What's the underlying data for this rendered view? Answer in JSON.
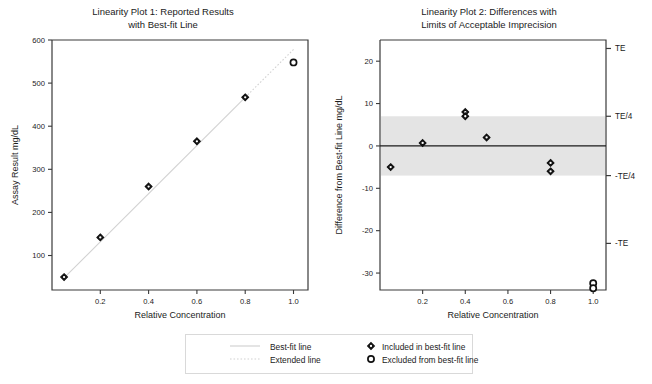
{
  "figure": {
    "width": 652,
    "height": 384,
    "background": "#ffffff"
  },
  "legend": {
    "items": [
      {
        "label": "Best-fit line",
        "marker": "solid-line-swatch"
      },
      {
        "label": "Extended line",
        "marker": "dotted-line-swatch"
      },
      {
        "label": "Included in best-fit line",
        "marker": "filled-diamond-swatch"
      },
      {
        "label": "Excluded from best-fit line",
        "marker": "open-circle-swatch"
      }
    ]
  },
  "colors": {
    "axis": "#3a3a3a",
    "text": "#1b1b1b",
    "marker_included": "#111111",
    "marker_excluded": "#111111",
    "fit_line": "#d2d2d2",
    "extended_line": "#d2d2d2",
    "band_fill": "#e4e4e4",
    "zero_line": "#1b1b1b",
    "legend_border": "#d9d9d9"
  },
  "chart_data": [
    {
      "type": "scatter",
      "id": "linearity-plot-1",
      "title": "Linearity Plot 1:  Reported Results\nwith Best-fit Line",
      "xlabel": "Relative Concentration",
      "ylabel": "Assay Result mg/dL",
      "xlim": [
        0.0,
        1.06
      ],
      "ylim": [
        20,
        600
      ],
      "xticks": [
        0.2,
        0.4,
        0.6,
        0.8,
        1.0
      ],
      "xticklabels": [
        "0.2",
        "0.4",
        "0.6",
        "0.8",
        "1.0"
      ],
      "yticks": [
        100,
        200,
        300,
        400,
        500,
        600
      ],
      "yticklabels": [
        "100",
        "200",
        "300",
        "400",
        "500",
        "600"
      ],
      "grid": false,
      "legend_position": "below-figure",
      "series": [
        {
          "name": "Included in best-fit line",
          "marker": "filled-diamond",
          "x": [
            0.05,
            0.2,
            0.4,
            0.6,
            0.8
          ],
          "y": [
            50,
            142,
            260,
            365,
            467
          ]
        },
        {
          "name": "Excluded from best-fit line",
          "marker": "open-circle",
          "x": [
            1.0
          ],
          "y": [
            548
          ]
        }
      ],
      "lines": [
        {
          "name": "Best-fit line",
          "style": "solid",
          "x": [
            0.05,
            0.8
          ],
          "y": [
            48,
            467
          ]
        },
        {
          "name": "Extended line",
          "style": "dotted",
          "x": [
            0.8,
            1.0
          ],
          "y": [
            467,
            578
          ]
        }
      ]
    },
    {
      "type": "scatter",
      "id": "linearity-plot-2",
      "title": "Linearity Plot 2: Differences with\nLimits of Acceptable Imprecision",
      "xlabel": "Relative Concentration",
      "ylabel": "Difference from Best-fit Line mg/dL",
      "xlim": [
        0.0,
        1.06
      ],
      "ylim": [
        -34,
        25
      ],
      "xticks": [
        0.2,
        0.4,
        0.6,
        0.8,
        1.0
      ],
      "xticklabels": [
        "0.2",
        "0.4",
        "0.6",
        "0.8",
        "1.0"
      ],
      "yticks": [
        20,
        10,
        0,
        -10,
        -20,
        -30
      ],
      "yticklabels": [
        "20",
        "10",
        "0",
        "-10",
        "-20",
        "-30"
      ],
      "right_axis_ticks": [
        23,
        7,
        -7,
        -23
      ],
      "right_axis_ticklabels": [
        "TE",
        "TE/4",
        "-TE/4",
        "-TE"
      ],
      "grid": false,
      "zero_line": 0,
      "shaded_band": {
        "label": "Limits of Acceptable Imprecision",
        "from": -7,
        "to": 7
      },
      "series": [
        {
          "name": "Included in best-fit line",
          "marker": "filled-diamond",
          "x": [
            0.05,
            0.2,
            0.4,
            0.4,
            0.5,
            0.8,
            0.8
          ],
          "y": [
            -5,
            0.7,
            8,
            7,
            2,
            -4,
            -6
          ]
        },
        {
          "name": "Excluded from best-fit line",
          "marker": "open-circle",
          "x": [
            1.0,
            1.0
          ],
          "y": [
            -32.4,
            -33.6
          ]
        }
      ]
    }
  ]
}
